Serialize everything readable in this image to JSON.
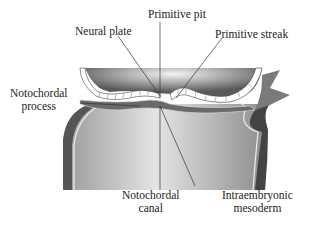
{
  "diagram": {
    "labels": {
      "primitive_pit": "Primitive pit",
      "neural_plate": "Neural plate",
      "primitive_streak": "Primitive streak",
      "notochordal_process_1": "Notochordal",
      "notochordal_process_2": "process",
      "notochordal_canal_1": "Notochordal",
      "notochordal_canal_2": "canal",
      "intraembryonic_mesoderm_1": "Intraembryonic",
      "intraembryonic_mesoderm_2": "mesoderm"
    },
    "colors": {
      "dark_tissue": "#3a3a3a",
      "mid_tissue": "#8a8a8a",
      "light_tissue": "#d8d8d8",
      "highlight": "#ffffff",
      "leader_line": "#333333"
    }
  }
}
